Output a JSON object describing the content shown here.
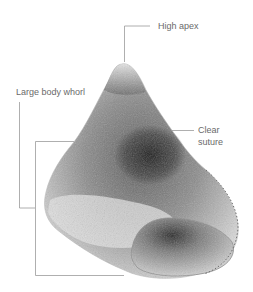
{
  "figure": {
    "background_color": "#ffffff",
    "leader_color": "#9a9a9a",
    "label_color": "#6a6a6a"
  },
  "labels": {
    "apex": "High apex",
    "body_whorl": "Large body whorl",
    "suture": "Clear suture"
  }
}
